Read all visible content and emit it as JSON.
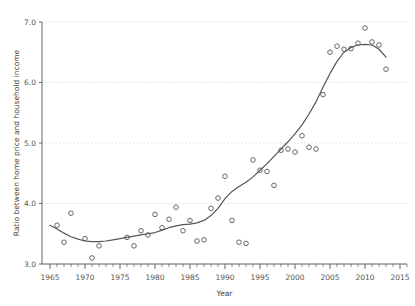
{
  "chart_data": {
    "type": "scatter",
    "title": "",
    "subtitle": "",
    "xlabel": "Year",
    "ylabel": "Ratio between home price and household income",
    "xlim": [
      1965,
      2016
    ],
    "ylim": [
      3.0,
      7.0
    ],
    "grid": true,
    "legend": null,
    "xticks": [
      1965,
      1970,
      1975,
      1980,
      1985,
      1990,
      1995,
      2000,
      2005,
      2010,
      2015
    ],
    "xtick_labels": [
      "1965",
      "1970",
      "1975",
      "1980",
      "1985",
      "1990",
      "1995",
      "2000",
      "2005",
      "2010",
      "2015"
    ],
    "yticks": [
      3.0,
      4.0,
      5.0,
      6.0,
      7.0
    ],
    "ytick_labels": [
      "3.0",
      "4.0",
      "5.0",
      "6.0",
      "7.0"
    ],
    "minor_xtick_interval": 1,
    "marker": "open-circle",
    "marker_color": "#555555",
    "line_color": "#555555",
    "grid_color": "#d8d8d8",
    "axis_color": "#666666",
    "background": "#ffffff",
    "series": [
      {
        "name": "Observed ratio",
        "kind": "scatter",
        "x": [
          1966,
          1967,
          1968,
          1970,
          1971,
          1972,
          1976,
          1977,
          1978,
          1979,
          1980,
          1981,
          1982,
          1983,
          1984,
          1985,
          1986,
          1987,
          1988,
          1989,
          1990,
          1991,
          1992,
          1993,
          1994,
          1995,
          1996,
          1997,
          1998,
          1999,
          2000,
          2001,
          2002,
          2003,
          2004,
          2005,
          2006,
          2007,
          2008,
          2009,
          2010,
          2011,
          2012,
          2013
        ],
        "y": [
          3.64,
          3.36,
          3.84,
          3.42,
          3.1,
          3.3,
          3.44,
          3.3,
          3.55,
          3.48,
          3.82,
          3.6,
          3.74,
          3.94,
          3.55,
          3.72,
          3.38,
          3.4,
          3.92,
          4.09,
          4.45,
          3.72,
          3.36,
          3.34,
          4.72,
          4.55,
          4.53,
          4.3,
          4.88,
          4.9,
          4.85,
          5.12,
          4.93,
          4.9,
          5.8,
          6.5,
          6.6,
          6.55,
          6.56,
          6.65,
          6.9,
          6.67,
          6.62,
          6.22
        ]
      },
      {
        "name": "Smoothed trend",
        "kind": "line",
        "x": [
          1965,
          1966,
          1967,
          1968,
          1969,
          1970,
          1971,
          1972,
          1973,
          1974,
          1975,
          1976,
          1977,
          1978,
          1979,
          1980,
          1981,
          1982,
          1983,
          1984,
          1985,
          1986,
          1987,
          1988,
          1989,
          1990,
          1991,
          1992,
          1993,
          1994,
          1995,
          1996,
          1997,
          1998,
          1999,
          2000,
          2001,
          2002,
          2003,
          2004,
          2005,
          2006,
          2007,
          2008,
          2009,
          2010,
          2011,
          2012,
          2013
        ],
        "y": [
          3.64,
          3.58,
          3.51,
          3.45,
          3.41,
          3.38,
          3.37,
          3.37,
          3.38,
          3.4,
          3.42,
          3.44,
          3.46,
          3.48,
          3.5,
          3.52,
          3.56,
          3.6,
          3.63,
          3.65,
          3.66,
          3.68,
          3.72,
          3.8,
          3.92,
          4.08,
          4.2,
          4.28,
          4.35,
          4.44,
          4.55,
          4.66,
          4.78,
          4.9,
          5.02,
          5.15,
          5.3,
          5.48,
          5.68,
          5.92,
          6.15,
          6.35,
          6.5,
          6.58,
          6.62,
          6.63,
          6.62,
          6.55,
          6.42
        ]
      }
    ]
  }
}
